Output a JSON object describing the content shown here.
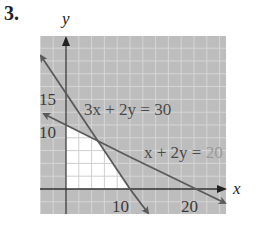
{
  "problem": {
    "number": "3."
  },
  "graph": {
    "x_axis_label": "x",
    "y_axis_label": "y",
    "x_ticks": [
      "10",
      "20"
    ],
    "y_ticks": [
      "10",
      "15"
    ],
    "lines": [
      {
        "equation": "3x + 2y = 30",
        "x_intercept": 10,
        "y_intercept": 15
      },
      {
        "equation_left": "x + 2y = ",
        "equation_right": "20",
        "equation": "x + 2y = 20",
        "x_intercept": 20,
        "y_intercept": 10
      }
    ],
    "feasible_region_vertices": [
      [
        0,
        0
      ],
      [
        10,
        0
      ],
      [
        5,
        7.5
      ],
      [
        0,
        10
      ]
    ],
    "grid_step": 2,
    "x_range": [
      -4,
      25
    ],
    "y_range": [
      -4,
      24
    ],
    "colors": {
      "shaded": "#bdbdbd",
      "shaded_grid": "#d6d6d6",
      "feasible": "#ffffff",
      "feasible_grid": "#cfcfcf",
      "lines": "#5a5a5a",
      "axes": "#333333"
    }
  }
}
